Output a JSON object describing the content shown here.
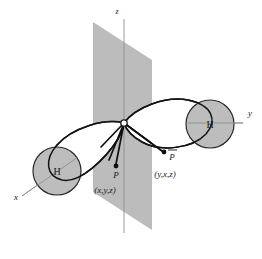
{
  "figure": {
    "background_color": "#ffffff",
    "plane_color": "#bcbcbc",
    "atom_color": "#bdbdbd",
    "line_color": "#151515",
    "axis_color": "#8e8e8e"
  },
  "axes": [
    {
      "id": "z",
      "label": "z",
      "label_x": 117,
      "label_y": 14
    },
    {
      "id": "y",
      "label": "y",
      "label_x": 250,
      "label_y": 116
    },
    {
      "id": "x",
      "label": "x",
      "label_x": 16,
      "label_y": 200
    }
  ],
  "atoms": [
    {
      "id": "h-left",
      "label": "H",
      "cx": 57,
      "cy": 171,
      "r": 24,
      "label_x": 57,
      "label_y": 175
    },
    {
      "id": "h-right",
      "label": "H",
      "cx": 210,
      "cy": 124,
      "r": 24,
      "label_x": 210,
      "label_y": 128
    }
  ],
  "origin": {
    "label": "O",
    "cx": 124,
    "cy": 123,
    "r": 3.2
  },
  "points": [
    {
      "id": "p-front",
      "label": "P",
      "overbar": false,
      "dot_x": 116,
      "dot_y": 166,
      "label_x": 116,
      "label_y": 178,
      "coords": "(x,y,z)",
      "coords_x": 105,
      "coords_y": 193
    },
    {
      "id": "p-reflected",
      "label": "P",
      "overbar": true,
      "dot_x": 164,
      "dot_y": 152,
      "label_x": 172,
      "label_y": 160,
      "coords": "(y,x,z)",
      "coords_x": 165,
      "coords_y": 177
    }
  ],
  "mirror_plane": {
    "name": "sigma-v-mirror-plane",
    "points": "93,22 152,60 152,230 93,192"
  },
  "lobes": [
    {
      "id": "lobe-left",
      "name": "bond-lobe-left"
    },
    {
      "id": "lobe-right",
      "name": "bond-lobe-right"
    }
  ]
}
